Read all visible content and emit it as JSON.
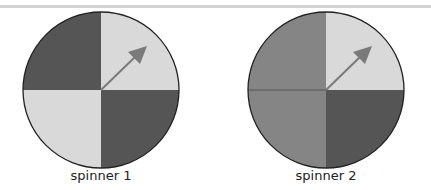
{
  "spinners": [
    {
      "label": "spinner 1",
      "quadrant_colors": {
        "top_left": "#555555",
        "top_right": "#d9d9d9",
        "bottom_left": "#d9d9d9",
        "bottom_right": "#555555"
      }
    },
    {
      "label": "spinner 2",
      "quadrant_colors": {
        "top_left": "#858585",
        "top_right": "#d9d9d9",
        "bottom_left": "#858585",
        "bottom_right": "#555555"
      }
    }
  ],
  "arrow_color": "#7a7a7a",
  "divider_color": "#d2d2d2"
}
